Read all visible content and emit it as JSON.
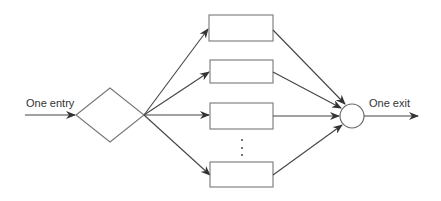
{
  "diagram": {
    "entry_label": "One entry",
    "exit_label": "One exit",
    "nodes": {
      "decision": {
        "shape": "diamond"
      },
      "processes": [
        {
          "shape": "rectangle",
          "index": 1
        },
        {
          "shape": "rectangle",
          "index": 2
        },
        {
          "shape": "rectangle",
          "index": 3
        },
        {
          "shape": "rectangle",
          "index": "n"
        }
      ],
      "ellipsis": "⋮",
      "junction": {
        "shape": "circle"
      }
    },
    "colors": {
      "stroke": "#444444",
      "background": "#ffffff"
    }
  }
}
